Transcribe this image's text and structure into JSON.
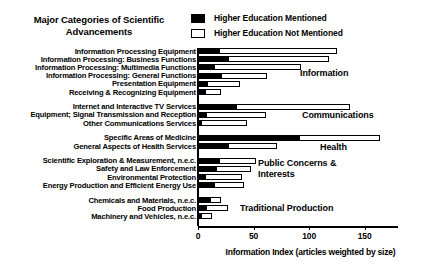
{
  "title": "Major Categories of Scientific Advancements",
  "title_line1": "Major Categories of Scientific",
  "title_line2": "Advancements",
  "legend": {
    "items": [
      {
        "label": "Higher Education Mentioned",
        "swatch": "filled",
        "color": "#000000"
      },
      {
        "label": "Higher Education Not Mentioned",
        "swatch": "hollow",
        "color": "#ffffff"
      }
    ]
  },
  "axis": {
    "xlabel": "Information Index (articles weighted by size)",
    "ticks": [
      0,
      50,
      100,
      150
    ],
    "xmin": 0,
    "xmax": 180
  },
  "group_labels": [
    {
      "text": "Information",
      "top": 68,
      "left": 300
    },
    {
      "text": "Communications",
      "top": 110,
      "left": 302
    },
    {
      "text": "Health",
      "top": 142,
      "left": 320
    },
    {
      "text": "Public Concerns &",
      "top": 158,
      "left": 258
    },
    {
      "text": "Interests",
      "top": 169,
      "left": 258
    },
    {
      "text": "Traditional Production",
      "top": 203,
      "left": 240
    }
  ],
  "chart_data": {
    "type": "bar",
    "orientation": "horizontal",
    "stacked": true,
    "title": "Major Categories of Scientific Advancements",
    "xlabel": "Information Index (articles weighted by size)",
    "ylabel": "",
    "xlim": [
      0,
      180
    ],
    "grid": false,
    "legend_position": "top-right",
    "series": [
      {
        "name": "Higher Education Mentioned",
        "color": "#000000"
      },
      {
        "name": "Higher Education Not Mentioned",
        "color": "#ffffff"
      }
    ],
    "groups": [
      {
        "name": "Information",
        "categories": [
          {
            "label": "Information Processing Equipment",
            "mentioned": 19,
            "not_mentioned": 106,
            "total": 125
          },
          {
            "label": "Information Processing: Business Functions",
            "mentioned": 27,
            "not_mentioned": 91,
            "total": 118
          },
          {
            "label": "Information Processing: Multimedia Functions",
            "mentioned": 14,
            "not_mentioned": 79,
            "total": 93
          },
          {
            "label": "Information Processing: General Functions",
            "mentioned": 21,
            "not_mentioned": 41,
            "total": 62
          },
          {
            "label": "Presentation Equipment",
            "mentioned": 8,
            "not_mentioned": 30,
            "total": 38
          },
          {
            "label": "Receiving & Recognizing Equipment",
            "mentioned": 6,
            "not_mentioned": 15,
            "total": 21
          }
        ]
      },
      {
        "name": "Communications",
        "categories": [
          {
            "label": "Internet and Interactive TV Services",
            "mentioned": 34,
            "not_mentioned": 103,
            "total": 137
          },
          {
            "label": "Equipment; Signal Transmission and Reception",
            "mentioned": 7,
            "not_mentioned": 54,
            "total": 61
          },
          {
            "label": "Other Communications Services",
            "mentioned": 3,
            "not_mentioned": 41,
            "total": 44
          }
        ]
      },
      {
        "name": "Health",
        "categories": [
          {
            "label": "Specific Areas of Medicine",
            "mentioned": 91,
            "not_mentioned": 73,
            "total": 164
          },
          {
            "label": "General Aspects of Health Services",
            "mentioned": 27,
            "not_mentioned": 44,
            "total": 71
          }
        ]
      },
      {
        "name": "Public Concerns & Interests",
        "categories": [
          {
            "label": "Scientific Exploration & Measurement, n.e.c.",
            "mentioned": 19,
            "not_mentioned": 33,
            "total": 52
          },
          {
            "label": "Safety and Law Enforcement",
            "mentioned": 16,
            "not_mentioned": 32,
            "total": 48
          },
          {
            "label": "Environmental Protection",
            "mentioned": 6,
            "not_mentioned": 34,
            "total": 40
          },
          {
            "label": "Energy Production and Efficient Energy Use",
            "mentioned": 14,
            "not_mentioned": 27,
            "total": 41
          }
        ]
      },
      {
        "name": "Traditional Production",
        "categories": [
          {
            "label": "Chemicals and Materials, n.e.c.",
            "mentioned": 11,
            "not_mentioned": 10,
            "total": 21
          },
          {
            "label": "Food Production",
            "mentioned": 7,
            "not_mentioned": 20,
            "total": 27
          },
          {
            "label": "Machinery and Vehicles, n.e.c.",
            "mentioned": 3,
            "not_mentioned": 10,
            "total": 13
          }
        ]
      }
    ]
  }
}
